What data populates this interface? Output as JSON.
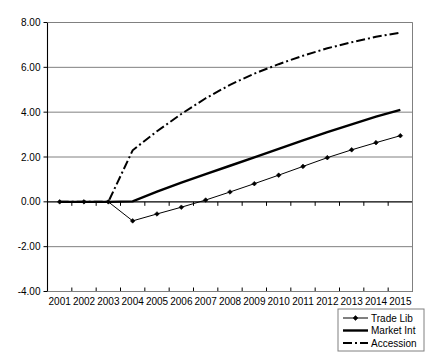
{
  "chart_data": {
    "type": "line",
    "title": "",
    "xlabel": "",
    "ylabel": "",
    "categories": [
      "2001",
      "2002",
      "2003",
      "2004",
      "2005",
      "2006",
      "2007",
      "2008",
      "2009",
      "2010",
      "2011",
      "2012",
      "2013",
      "2014",
      "2015"
    ],
    "ylim": [
      -4.0,
      8.0
    ],
    "y_ticks": [
      -4.0,
      -2.0,
      0.0,
      2.0,
      4.0,
      6.0,
      8.0
    ],
    "y_tick_labels": [
      "-4.00",
      "-2.00",
      "0.00",
      "2.00",
      "4.00",
      "6.00",
      "8.00"
    ],
    "grid": true,
    "legend_position": "bottom-right",
    "series": [
      {
        "name": "Trade Lib",
        "style": "thin-line-with-diamond-markers",
        "markers": true,
        "values": [
          0.0,
          0.0,
          0.0,
          -0.85,
          -0.54,
          -0.24,
          0.08,
          0.44,
          0.81,
          1.19,
          1.58,
          1.97,
          2.32,
          2.64,
          2.95
        ]
      },
      {
        "name": "Market Int",
        "style": "thick-solid-line",
        "markers": false,
        "values": [
          0.0,
          0.0,
          0.0,
          0.02,
          0.46,
          0.86,
          1.24,
          1.61,
          1.98,
          2.36,
          2.74,
          3.11,
          3.46,
          3.8,
          4.1
        ]
      },
      {
        "name": "Accession",
        "style": "dash-dot-line",
        "markers": false,
        "values": [
          0.0,
          0.0,
          0.0,
          2.3,
          3.15,
          3.92,
          4.62,
          5.22,
          5.72,
          6.14,
          6.52,
          6.85,
          7.12,
          7.36,
          7.55
        ]
      }
    ]
  },
  "legend": {
    "entries": [
      {
        "label": "Trade Lib"
      },
      {
        "label": "Market Int"
      },
      {
        "label": "Accession"
      }
    ]
  },
  "colors": {
    "series": "#000000",
    "gridline": "#808080",
    "background": "#ffffff"
  }
}
